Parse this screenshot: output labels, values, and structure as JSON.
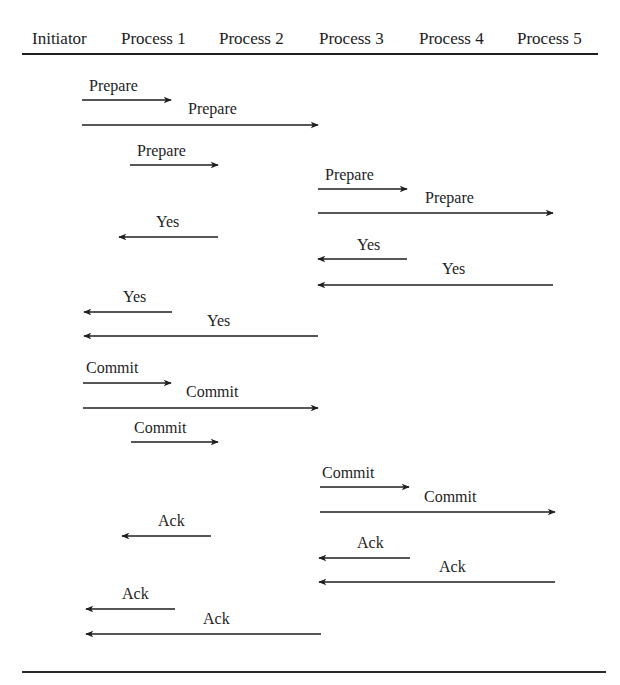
{
  "diagram": {
    "type": "sequence",
    "title": "",
    "participants": [
      {
        "id": "initiator",
        "label": "Initiator",
        "x": 32
      },
      {
        "id": "p1",
        "label": "Process 1",
        "x": 121
      },
      {
        "id": "p2",
        "label": "Process 2",
        "x": 219
      },
      {
        "id": "p3",
        "label": "Process 3",
        "x": 319
      },
      {
        "id": "p4",
        "label": "Process 4",
        "x": 419
      },
      {
        "id": "p5",
        "label": "Process 5",
        "x": 517
      }
    ],
    "colors": {
      "line": "#1e1e1e",
      "text": "#1c1c1c",
      "background": "#ffffff"
    },
    "messages": [
      {
        "label": "Prepare",
        "from": "Initiator",
        "to": "Process 1",
        "direction": "right",
        "x1": 82,
        "x2": 171,
        "y": 100,
        "label_x": 89,
        "label_y": 77
      },
      {
        "label": "Prepare",
        "from": "Initiator",
        "to": "Process 3",
        "direction": "right",
        "x1": 82,
        "x2": 318,
        "y": 125,
        "label_x": 188,
        "label_y": 100
      },
      {
        "label": "Prepare",
        "from": "Process 1",
        "to": "Process 2",
        "direction": "right",
        "x1": 130,
        "x2": 218,
        "y": 165,
        "label_x": 137,
        "label_y": 142
      },
      {
        "label": "Prepare",
        "from": "Process 3",
        "to": "Process 4",
        "direction": "right",
        "x1": 318,
        "x2": 407,
        "y": 189,
        "label_x": 325,
        "label_y": 166
      },
      {
        "label": "Prepare",
        "from": "Process 3",
        "to": "Process 5",
        "direction": "right",
        "x1": 318,
        "x2": 553,
        "y": 213,
        "label_x": 425,
        "label_y": 189
      },
      {
        "label": "Yes",
        "from": "Process 2",
        "to": "Process 1",
        "direction": "left",
        "x1": 218,
        "x2": 119,
        "y": 237,
        "label_x": 156,
        "label_y": 213
      },
      {
        "label": "Yes",
        "from": "Process 4",
        "to": "Process 3",
        "direction": "left",
        "x1": 407,
        "x2": 318,
        "y": 259,
        "label_x": 357,
        "label_y": 236
      },
      {
        "label": "Yes",
        "from": "Process 5",
        "to": "Process 3",
        "direction": "left",
        "x1": 553,
        "x2": 318,
        "y": 285,
        "label_x": 442,
        "label_y": 260
      },
      {
        "label": "Yes",
        "from": "Process 1",
        "to": "Initiator",
        "direction": "left",
        "x1": 172,
        "x2": 84,
        "y": 312,
        "label_x": 123,
        "label_y": 288
      },
      {
        "label": "Yes",
        "from": "Process 3",
        "to": "Initiator",
        "direction": "left",
        "x1": 318,
        "x2": 84,
        "y": 336,
        "label_x": 207,
        "label_y": 312
      },
      {
        "label": "Commit",
        "from": "Initiator",
        "to": "Process 1",
        "direction": "right",
        "x1": 83,
        "x2": 171,
        "y": 383,
        "label_x": 86,
        "label_y": 359
      },
      {
        "label": "Commit",
        "from": "Initiator",
        "to": "Process 3",
        "direction": "right",
        "x1": 83,
        "x2": 318,
        "y": 408,
        "label_x": 186,
        "label_y": 383
      },
      {
        "label": "Commit",
        "from": "Process 1",
        "to": "Process 2",
        "direction": "right",
        "x1": 131,
        "x2": 218,
        "y": 442,
        "label_x": 134,
        "label_y": 419
      },
      {
        "label": "Commit",
        "from": "Process 3",
        "to": "Process 4",
        "direction": "right",
        "x1": 320,
        "x2": 409,
        "y": 487,
        "label_x": 322,
        "label_y": 464
      },
      {
        "label": "Commit",
        "from": "Process 3",
        "to": "Process 5",
        "direction": "right",
        "x1": 320,
        "x2": 555,
        "y": 512,
        "label_x": 424,
        "label_y": 488
      },
      {
        "label": "Ack",
        "from": "Process 2",
        "to": "Process 1",
        "direction": "left",
        "x1": 211,
        "x2": 122,
        "y": 536,
        "label_x": 158,
        "label_y": 512
      },
      {
        "label": "Ack",
        "from": "Process 4",
        "to": "Process 3",
        "direction": "left",
        "x1": 410,
        "x2": 319,
        "y": 558,
        "label_x": 357,
        "label_y": 534
      },
      {
        "label": "Ack",
        "from": "Process 5",
        "to": "Process 3",
        "direction": "left",
        "x1": 555,
        "x2": 319,
        "y": 582,
        "label_x": 439,
        "label_y": 558
      },
      {
        "label": "Ack",
        "from": "Process 1",
        "to": "Initiator",
        "direction": "left",
        "x1": 175,
        "x2": 86,
        "y": 609,
        "label_x": 122,
        "label_y": 585
      },
      {
        "label": "Ack",
        "from": "Process 3",
        "to": "Initiator",
        "direction": "left",
        "x1": 321,
        "x2": 86,
        "y": 634,
        "label_x": 203,
        "label_y": 610
      }
    ]
  }
}
